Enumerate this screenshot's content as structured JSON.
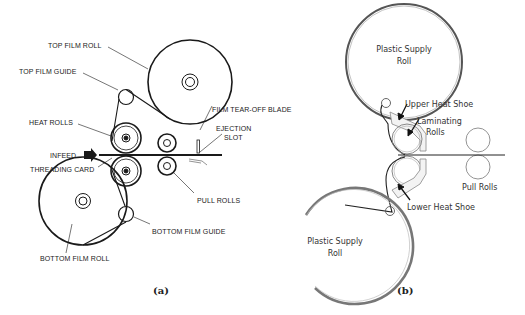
{
  "figure": {
    "panel_a": {
      "caption": "(a)",
      "labels": {
        "top_film_roll": "TOP FILM ROLL",
        "top_film_guide": "TOP FILM GUIDE",
        "heat_rolls": "HEAT ROLLS",
        "infeed": "INFEED",
        "threading_card": "THREADING CARD",
        "film_tear_off_blade": "FILM TEAR-OFF BLADE",
        "ejection_slot_1": "EJECTION",
        "ejection_slot_2": "SLOT",
        "pull_rolls": "PULL ROLLS",
        "bottom_film_guide": "BOTTOM FILM GUIDE",
        "bottom_film_roll": "BOTTOM FILM ROLL"
      }
    },
    "panel_b": {
      "caption": "(b)",
      "labels": {
        "upper_supply_roll_1": "Plastic Supply",
        "upper_supply_roll_2": "Roll",
        "upper_heat_shoe": "Upper Heat Shoe",
        "laminating_rolls_1": "Laminating",
        "laminating_rolls_2": "Rolls",
        "pull_rolls": "Pull Rolls",
        "lower_heat_shoe": "Lower Heat Shoe",
        "lower_supply_roll_1": "Plastic Supply",
        "lower_supply_roll_2": "Roll"
      }
    },
    "colors": {
      "line_a": "#1a1a1a",
      "line_b": "#555555",
      "background": "#ffffff"
    }
  }
}
